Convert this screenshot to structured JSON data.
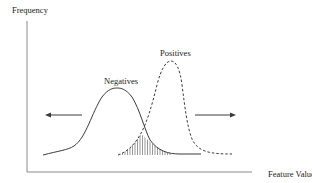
{
  "diagram": {
    "type": "overlapping-distributions",
    "y_axis_label": "Frequency",
    "x_axis_label": "Feature Value",
    "curves": [
      {
        "name": "Negatives",
        "style": "solid",
        "peak_x": 117,
        "peak_y": 89
      },
      {
        "name": "Positives",
        "style": "dashed",
        "peak_x": 171,
        "peak_y": 61
      }
    ],
    "overlap_region": "hatched",
    "arrows": [
      {
        "direction": "left"
      },
      {
        "direction": "right"
      }
    ]
  },
  "labels": {
    "frequency": "Frequency",
    "feature_value": "Feature Value",
    "negatives": "Negatives",
    "positives": "Positives"
  },
  "colors": {
    "line": "#3a3a3a",
    "axis": "#8a8a8a",
    "hatch": "#6a6a6a"
  }
}
